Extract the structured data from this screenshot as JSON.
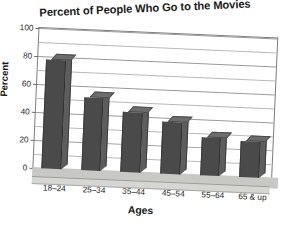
{
  "chart_data": {
    "type": "bar",
    "title": "Percent of People Who Go to the Movies",
    "xlabel": "Ages",
    "ylabel": "Percent",
    "categories": [
      "18–24",
      "25–34",
      "35–44",
      "45–54",
      "55–64",
      "65 & up"
    ],
    "values": [
      78,
      52,
      43,
      37,
      27,
      26
    ],
    "ylim": [
      0,
      100
    ],
    "ytick_labels": [
      "0",
      "20",
      "40",
      "60",
      "80",
      "100"
    ],
    "ytick_values": [
      0,
      20,
      40,
      60,
      80,
      100
    ],
    "minor_gridline_values": [
      10,
      30,
      50,
      70,
      90
    ],
    "grid": true,
    "legend": false,
    "style": {
      "bar_face_color": "#4a4a4a",
      "bar_top_color": "#6c6c6c",
      "bar_side_color": "#5d5d5d",
      "floor_color": "#c8c8c4",
      "gridline_color": "#b9b9b9",
      "axis_color": "#7d7d7d",
      "text_color": "#1a1a1a",
      "background": "#ffffff"
    },
    "render_hints": {
      "three_d": true,
      "scan_rotation_deg": 2.5
    }
  }
}
